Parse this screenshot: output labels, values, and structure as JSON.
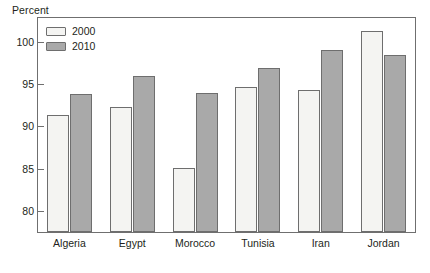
{
  "chart_data": {
    "type": "bar",
    "title": "",
    "ylabel": "Percent",
    "xlabel": "",
    "categories": [
      "Algeria",
      "Egypt",
      "Morocco",
      "Tunisia",
      "Iran",
      "Jordan"
    ],
    "series": [
      {
        "name": "2000",
        "color": "#f4f4f2",
        "values": [
          91.3,
          92.3,
          85.1,
          94.6,
          94.3,
          101.3
        ]
      },
      {
        "name": "2010",
        "color": "#a9a9a9",
        "values": [
          93.8,
          95.9,
          93.9,
          96.9,
          99.0,
          98.4
        ]
      }
    ],
    "ylim": [
      77.5,
      102.8
    ],
    "yticks": [
      80,
      85,
      90,
      95,
      100
    ],
    "ytick_labels": [
      "80",
      "85",
      "90",
      "95",
      "100"
    ],
    "grid": false,
    "legend_position": "top-left"
  },
  "legend": {
    "entries": [
      {
        "label": "2000"
      },
      {
        "label": "2010"
      }
    ]
  },
  "axis": {
    "y_title": "Percent"
  },
  "colors": {
    "series_2000": "#f4f4f2",
    "series_2010": "#a9a9a9",
    "axis_line": "#6f6f6f",
    "bar_outline": "#6e6e6e",
    "text": "#231f20"
  }
}
